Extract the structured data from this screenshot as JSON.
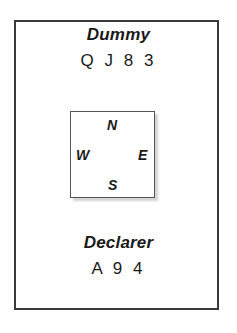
{
  "diagram": {
    "type": "bridge-hand-layout",
    "top_hand": {
      "label": "Dummy",
      "cards": "Q J 8 3"
    },
    "bottom_hand": {
      "label": "Declarer",
      "cards": "A 9 4"
    },
    "compass": {
      "north": "N",
      "west": "W",
      "east": "E",
      "south": "S"
    }
  }
}
